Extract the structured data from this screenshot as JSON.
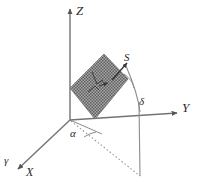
{
  "figure": {
    "background_color": "#ffffff",
    "line_color": "#6e6e6e",
    "label_color": "#2b2b2b",
    "panel_fill": "#8f8f8f",
    "width": 197,
    "height": 187
  },
  "axes": [
    {
      "name": "z-axis",
      "label": "Z",
      "from": [
        70,
        120
      ],
      "to": [
        70,
        8
      ],
      "arrow": true,
      "style": "solid"
    },
    {
      "name": "y-axis",
      "label": "Y",
      "from": [
        70,
        120
      ],
      "to": [
        178,
        113
      ],
      "arrow": true,
      "style": "solid"
    },
    {
      "name": "x-axis",
      "label": "X",
      "from": [
        70,
        120
      ],
      "to": [
        17,
        170
      ],
      "arrow": true,
      "style": "solid"
    }
  ],
  "labels": {
    "z": "Z",
    "y": "Y",
    "x": "X",
    "gamma": "γ",
    "s": "S",
    "delta": "δ",
    "alpha": "α"
  },
  "angles": [
    {
      "name": "alpha",
      "symbol": "α",
      "meaning": "azimuth angle in the XY plane at the origin",
      "label_pos": [
        70,
        128
      ]
    },
    {
      "name": "delta",
      "symbol": "δ",
      "meaning": "declination / tilt angle at the solar vector",
      "label_pos": [
        139,
        96
      ]
    }
  ],
  "vectors": [
    {
      "name": "s-vector",
      "symbol": "S",
      "from": [
        112,
        80
      ],
      "to": [
        128,
        62
      ],
      "arrow": true,
      "label_pos": [
        124,
        52
      ]
    }
  ],
  "surface": {
    "name": "tilted-plane",
    "description": "hatched tilted rectangular surface (collector plane)",
    "points": [
      [
        70,
        88
      ],
      [
        104,
        54
      ],
      [
        128,
        78
      ],
      [
        95,
        119
      ]
    ],
    "fill": "#909090",
    "pattern": "cross-hatch"
  },
  "construction_lines": [
    {
      "name": "azimuth-projection",
      "style": "dashed",
      "from": [
        70,
        120
      ],
      "to": [
        140,
        176
      ]
    },
    {
      "name": "vertical-drop",
      "style": "solid",
      "from": [
        140,
        176
      ],
      "to": [
        139,
        108
      ]
    },
    {
      "name": "alpha-arc-chord",
      "style": "solid",
      "from": [
        70,
        120
      ],
      "to": [
        101,
        133
      ]
    }
  ]
}
